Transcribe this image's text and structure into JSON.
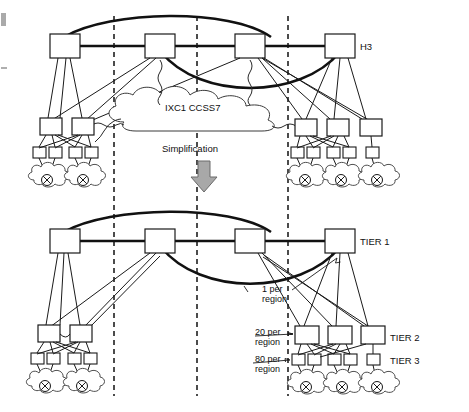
{
  "figure": {
    "title_text": "Hierarchical switched network before and after simplification",
    "background_color": "#ffffff",
    "ink_color": "#111111"
  },
  "labels": {
    "h3": "H3",
    "cloud_center": "IXC1 CCSS7",
    "simplification": "Simplification",
    "tier1": "TIER 1",
    "tier2": "TIER 2",
    "tier3": "TIER 3",
    "anno_1_line1": "1 per",
    "anno_1_line2": "region",
    "anno_20_line1": "20 per",
    "anno_20_line2": "region",
    "anno_80_line1": "80 per",
    "anno_80_line2": "region"
  },
  "icons": {
    "arrow": "down-arrow-icon",
    "switch": "switch-node-icon",
    "end_office": "end-office-cross-circle-icon",
    "access_cloud": "access-cloud-icon",
    "signaling_cloud": "signaling-cloud-icon"
  },
  "colors": {
    "node_fill": "#ffffff",
    "node_stroke": "#1a1a1a",
    "trunk": "#111111",
    "divider": "#111111",
    "arrow_fill": "#a8a8a8",
    "arrow_stroke": "#6b6b6b",
    "cloud_stroke": "#3a3a3a"
  },
  "diagram_data": {
    "type": "network-hierarchy",
    "panels": [
      {
        "name": "before",
        "description": "Pre-simplification hierarchy with IXC1 CCSS7 signaling cloud",
        "top_row_label": "H3",
        "top_nodes": 4,
        "left_mid_nodes": 2,
        "left_leaf_nodes": 4,
        "left_clouds": 2,
        "right_mid_nodes": 3,
        "right_leaf_nodes": 5,
        "right_clouds": 3
      },
      {
        "name": "after",
        "description": "Simplified three-tier hierarchy",
        "tier_labels": [
          "TIER 1",
          "TIER 2",
          "TIER 3"
        ],
        "top_nodes": 4,
        "left_mid_nodes": 2,
        "left_leaf_nodes": 4,
        "left_clouds": 2,
        "right_mid_nodes": 3,
        "right_leaf_nodes": 5,
        "right_clouds": 3,
        "annotations": [
          {
            "text": "1 per region",
            "points_to": "TIER 1"
          },
          {
            "text": "20 per region",
            "points_to": "TIER 2"
          },
          {
            "text": "80 per region",
            "points_to": "TIER 3"
          }
        ]
      }
    ],
    "region_dividers_x": [
      114,
      197,
      288
    ]
  }
}
